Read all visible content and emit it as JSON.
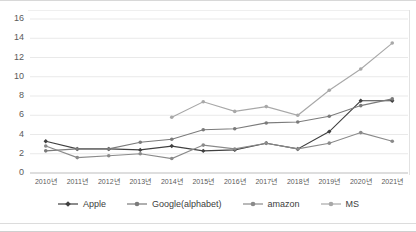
{
  "chart_data": {
    "type": "line",
    "title": "",
    "xlabel": "",
    "ylabel": "",
    "ylim": [
      0,
      16
    ],
    "ytick_step": 2,
    "grid": true,
    "legend_position": "bottom",
    "categories": [
      "2010년",
      "2011년",
      "2012년",
      "2013년",
      "2014년",
      "2015년",
      "2016년",
      "2017년",
      "2018년",
      "2019년",
      "2020년",
      "2021년"
    ],
    "yticks": [
      "0",
      "2",
      "4",
      "6",
      "8",
      "10",
      "12",
      "14",
      "16"
    ],
    "series": [
      {
        "name": "Apple",
        "color": "#404040",
        "marker": "diamond",
        "values": [
          3.3,
          2.5,
          2.5,
          2.4,
          2.8,
          2.3,
          2.4,
          3.1,
          2.5,
          4.3,
          7.5,
          7.5
        ]
      },
      {
        "name": "Google(alphabet)",
        "color": "#7b7b7b",
        "marker": "circle",
        "values": [
          2.3,
          2.5,
          2.5,
          3.2,
          3.5,
          4.5,
          4.6,
          5.2,
          5.3,
          5.9,
          7.0,
          7.7
        ]
      },
      {
        "name": "amazon",
        "color": "#8a8a8a",
        "marker": "circle",
        "values": [
          2.8,
          1.6,
          1.8,
          2.0,
          1.5,
          2.9,
          2.5,
          3.1,
          2.5,
          3.1,
          4.2,
          3.3
        ]
      },
      {
        "name": "MS",
        "color": "#a8a8a8",
        "marker": "circle",
        "values": [
          null,
          null,
          null,
          null,
          5.8,
          7.4,
          6.4,
          6.9,
          6.0,
          8.6,
          10.8,
          13.5
        ]
      }
    ]
  }
}
